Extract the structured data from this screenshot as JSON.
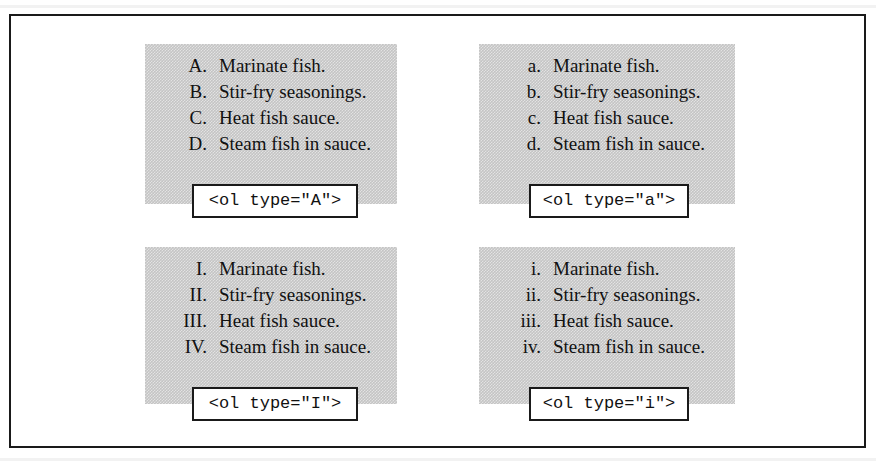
{
  "page": {
    "background_color": "#ffffff",
    "frame_border_color": "#1a1a1a",
    "panel_gray": "#c4c4c4",
    "text_color": "#111111"
  },
  "examples": [
    {
      "id": "type-uppercase-alpha",
      "code_label": "<ol type=\"A\">",
      "items": [
        {
          "marker": "A.",
          "text": "Marinate fish."
        },
        {
          "marker": "B.",
          "text": "Stir-fry seasonings."
        },
        {
          "marker": "C.",
          "text": "Heat fish sauce."
        },
        {
          "marker": "D.",
          "text": "Steam fish in sauce."
        }
      ]
    },
    {
      "id": "type-lowercase-alpha",
      "code_label": "<ol type=\"a\">",
      "items": [
        {
          "marker": "a.",
          "text": "Marinate fish."
        },
        {
          "marker": "b.",
          "text": "Stir-fry seasonings."
        },
        {
          "marker": "c.",
          "text": "Heat fish sauce."
        },
        {
          "marker": "d.",
          "text": "Steam fish in sauce."
        }
      ]
    },
    {
      "id": "type-uppercase-roman",
      "code_label": "<ol type=\"I\">",
      "items": [
        {
          "marker": "I.",
          "text": "Marinate fish."
        },
        {
          "marker": "II.",
          "text": "Stir-fry seasonings."
        },
        {
          "marker": "III.",
          "text": "Heat fish sauce."
        },
        {
          "marker": "IV.",
          "text": "Steam fish in sauce."
        }
      ]
    },
    {
      "id": "type-lowercase-roman",
      "code_label": "<ol type=\"i\">",
      "items": [
        {
          "marker": "i.",
          "text": "Marinate fish."
        },
        {
          "marker": "ii.",
          "text": "Stir-fry seasonings."
        },
        {
          "marker": "iii.",
          "text": "Heat fish sauce."
        },
        {
          "marker": "iv.",
          "text": "Steam fish in sauce."
        }
      ]
    }
  ]
}
